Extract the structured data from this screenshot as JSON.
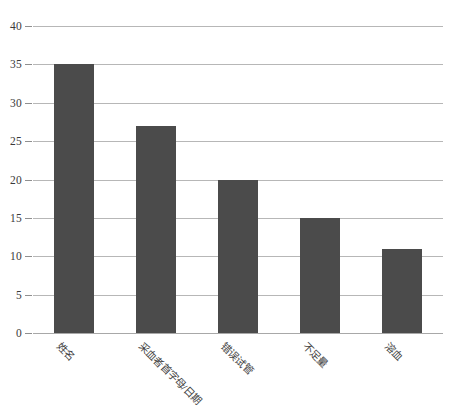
{
  "chart_data": {
    "type": "bar",
    "title": "",
    "subtitle": "",
    "xlabel": "",
    "ylabel": "",
    "categories": [
      "姓名",
      "采血者首字母/日期",
      "错误试管",
      "不足量",
      "溶血"
    ],
    "values": [
      35,
      27,
      20,
      15,
      11
    ],
    "series": [
      {
        "name": "",
        "values": [
          35,
          27,
          20,
          15,
          11
        ]
      }
    ],
    "ylim": [
      0,
      40
    ],
    "yticks": [
      0,
      5,
      10,
      15,
      20,
      25,
      30,
      35,
      40
    ],
    "ytick_labels": [
      "0",
      "5",
      "10",
      "15",
      "20",
      "25",
      "30",
      "35",
      "40"
    ],
    "grid": true,
    "grid_axis": "y",
    "legend": false,
    "legend_position": "none",
    "bar_color": "#4b4b4b",
    "gridline_color": "#b7b7b7",
    "background_color": "#ffffff",
    "xtick_rotation": 45,
    "annotations": []
  },
  "caption": {
    "text": ""
  }
}
